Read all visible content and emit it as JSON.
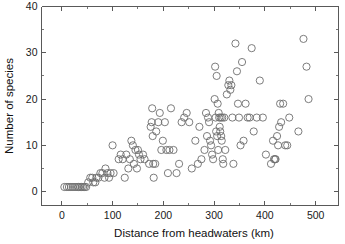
{
  "figure": {
    "background_color": "#ffffff",
    "marker_color": "#6e6e6e",
    "axis_color": "#595959",
    "text_color": "#111111"
  },
  "axes": {
    "xlabel": "Distance from headwaters (km)",
    "ylabel": "Number of species",
    "x_ticks": [
      "0",
      "100",
      "200",
      "300",
      "400",
      "500"
    ],
    "y_ticks": [
      "0",
      "10",
      "20",
      "30",
      "40"
    ]
  },
  "chart_data": {
    "type": "scatter",
    "title": "",
    "xlabel": "Distance from headwaters (km)",
    "ylabel": "Number of species",
    "xlim": [
      -40,
      545
    ],
    "ylim": [
      -3,
      40
    ],
    "x_ticks": [
      0,
      100,
      200,
      300,
      400,
      500
    ],
    "y_ticks": [
      0,
      10,
      20,
      30,
      40
    ],
    "x_minor_tick_step": 50,
    "y_minor_tick_step": 5,
    "grid": false,
    "legend": null,
    "marker": "open-circle",
    "marker_size": 3.6,
    "series": [
      {
        "name": "fish species richness",
        "points": [
          [
            5,
            1
          ],
          [
            10,
            1
          ],
          [
            14,
            1
          ],
          [
            18,
            1
          ],
          [
            22,
            1
          ],
          [
            26,
            1
          ],
          [
            30,
            1
          ],
          [
            33,
            1
          ],
          [
            36,
            1
          ],
          [
            39,
            1
          ],
          [
            42,
            1
          ],
          [
            45,
            1
          ],
          [
            48,
            1
          ],
          [
            52,
            2
          ],
          [
            56,
            3
          ],
          [
            60,
            3
          ],
          [
            62,
            2
          ],
          [
            66,
            2
          ],
          [
            68,
            3
          ],
          [
            72,
            3
          ],
          [
            76,
            4
          ],
          [
            80,
            4
          ],
          [
            84,
            3
          ],
          [
            86,
            5
          ],
          [
            90,
            4
          ],
          [
            93,
            3
          ],
          [
            96,
            4
          ],
          [
            100,
            10
          ],
          [
            102,
            4
          ],
          [
            112,
            7
          ],
          [
            116,
            8
          ],
          [
            120,
            7
          ],
          [
            124,
            3
          ],
          [
            127,
            8
          ],
          [
            131,
            5
          ],
          [
            134,
            7
          ],
          [
            137,
            11
          ],
          [
            140,
            10
          ],
          [
            142,
            6
          ],
          [
            145,
            9
          ],
          [
            148,
            5
          ],
          [
            150,
            9
          ],
          [
            152,
            8
          ],
          [
            155,
            7
          ],
          [
            160,
            8
          ],
          [
            163,
            7
          ],
          [
            172,
            6
          ],
          [
            175,
            14
          ],
          [
            177,
            15
          ],
          [
            178,
            18
          ],
          [
            179,
            12
          ],
          [
            180,
            6
          ],
          [
            181,
            3
          ],
          [
            184,
            6
          ],
          [
            186,
            13
          ],
          [
            190,
            15
          ],
          [
            193,
            17
          ],
          [
            196,
            9
          ],
          [
            199,
            11
          ],
          [
            203,
            15
          ],
          [
            206,
            9
          ],
          [
            209,
            4
          ],
          [
            212,
            9
          ],
          [
            215,
            18
          ],
          [
            220,
            9
          ],
          [
            226,
            4
          ],
          [
            231,
            6
          ],
          [
            236,
            15
          ],
          [
            241,
            16
          ],
          [
            246,
            17
          ],
          [
            251,
            15
          ],
          [
            256,
            5
          ],
          [
            263,
            11
          ],
          [
            268,
            6
          ],
          [
            271,
            14
          ],
          [
            275,
            7
          ],
          [
            281,
            9
          ],
          [
            284,
            17
          ],
          [
            286,
            12
          ],
          [
            288,
            16
          ],
          [
            290,
            15
          ],
          [
            292,
            11
          ],
          [
            294,
            10
          ],
          [
            296,
            8
          ],
          [
            298,
            7
          ],
          [
            301,
            20
          ],
          [
            302,
            27
          ],
          [
            303,
            16
          ],
          [
            304,
            13
          ],
          [
            305,
            25
          ],
          [
            306,
            12
          ],
          [
            307,
            19
          ],
          [
            308,
            9
          ],
          [
            309,
            17
          ],
          [
            310,
            16
          ],
          [
            311,
            14
          ],
          [
            312,
            13
          ],
          [
            313,
            16
          ],
          [
            314,
            12
          ],
          [
            315,
            11
          ],
          [
            316,
            16
          ],
          [
            317,
            7
          ],
          [
            318,
            6
          ],
          [
            320,
            16
          ],
          [
            322,
            9
          ],
          [
            325,
            21
          ],
          [
            328,
            23
          ],
          [
            330,
            24
          ],
          [
            332,
            22
          ],
          [
            334,
            23
          ],
          [
            336,
            16
          ],
          [
            338,
            6
          ],
          [
            342,
            32
          ],
          [
            345,
            26
          ],
          [
            347,
            19
          ],
          [
            349,
            16
          ],
          [
            352,
            10
          ],
          [
            355,
            28
          ],
          [
            358,
            11
          ],
          [
            362,
            19
          ],
          [
            366,
            16
          ],
          [
            370,
            16
          ],
          [
            374,
            31
          ],
          [
            378,
            13
          ],
          [
            384,
            16
          ],
          [
            390,
            24
          ],
          [
            396,
            16
          ],
          [
            402,
            8
          ],
          [
            412,
            6
          ],
          [
            416,
            11
          ],
          [
            418,
            7
          ],
          [
            420,
            7
          ],
          [
            421,
            7
          ],
          [
            424,
            12
          ],
          [
            426,
            10
          ],
          [
            428,
            14
          ],
          [
            430,
            19
          ],
          [
            432,
            15
          ],
          [
            436,
            19
          ],
          [
            440,
            10
          ],
          [
            444,
            10
          ],
          [
            448,
            16
          ],
          [
            466,
            13
          ],
          [
            476,
            33
          ],
          [
            482,
            27
          ],
          [
            486,
            20
          ]
        ]
      }
    ]
  }
}
